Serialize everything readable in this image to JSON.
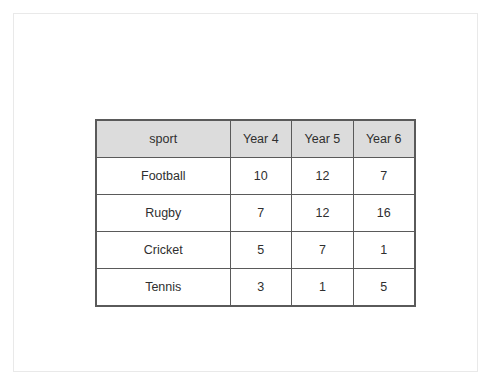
{
  "page": {
    "background_color": "#ffffff",
    "frame_border_color": "#e9e9e9"
  },
  "table": {
    "border_color": "#5a5a5a",
    "header_background": "#dcdcdc",
    "text_color": "#2f2f2f",
    "columns": [
      "sport",
      "Year 4",
      "Year 5",
      "Year 6"
    ],
    "rows": [
      {
        "sport": "Football",
        "year4": "10",
        "year5": "12",
        "year6": "7"
      },
      {
        "sport": "Rugby",
        "year4": "7",
        "year5": "12",
        "year6": "16"
      },
      {
        "sport": "Cricket",
        "year4": "5",
        "year5": "7",
        "year6": "1"
      },
      {
        "sport": "Tennis",
        "year4": "3",
        "year5": "1",
        "year6": "5"
      }
    ]
  },
  "chart_data": {
    "type": "table",
    "title": "",
    "categories": [
      "Football",
      "Rugby",
      "Cricket",
      "Tennis"
    ],
    "series": [
      {
        "name": "Year 4",
        "values": [
          10,
          7,
          5,
          3
        ]
      },
      {
        "name": "Year 5",
        "values": [
          12,
          12,
          7,
          1
        ]
      },
      {
        "name": "Year 6",
        "values": [
          7,
          16,
          1,
          5
        ]
      }
    ],
    "xlabel": "sport",
    "ylabel": "",
    "legend": [
      "Year 4",
      "Year 5",
      "Year 6"
    ],
    "grid": true
  }
}
